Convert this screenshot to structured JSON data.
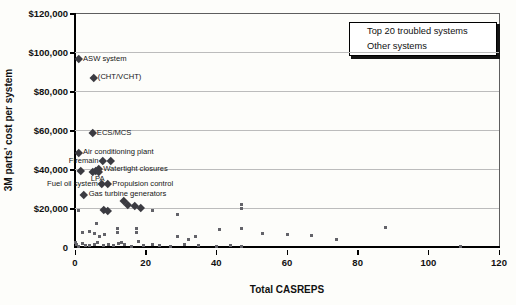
{
  "chart_data": {
    "type": "scatter",
    "title": "",
    "xlabel": "Total CASREPS",
    "ylabel": "3M parts' cost per system",
    "xlim": [
      0,
      120
    ],
    "ylim": [
      0,
      120000
    ],
    "grid": "horizontal",
    "legend_position": "top-right",
    "x_ticks": [
      0,
      20,
      40,
      60,
      80,
      100,
      120
    ],
    "y_ticks": [
      {
        "value": 120000,
        "label": "$120,000"
      },
      {
        "value": 100000,
        "label": "$100,000"
      },
      {
        "value": 80000,
        "label": "$80,000"
      },
      {
        "value": 60000,
        "label": "$60,000"
      },
      {
        "value": 40000,
        "label": "$40,000"
      },
      {
        "value": 20000,
        "label": "$20,000"
      },
      {
        "value": 0,
        "label": "0"
      }
    ],
    "series": [
      {
        "name": "Top 20 troubled systems",
        "marker": "diamond",
        "color": "#3b3b41",
        "points": [
          {
            "x": 1,
            "y": 96500,
            "label": "ASW system",
            "label_side": "right"
          },
          {
            "x": 5.2,
            "y": 87000,
            "label": "(CHT/VCHT)",
            "label_side": "right"
          },
          {
            "x": 4.9,
            "y": 58400,
            "label": "ECS/MCS",
            "label_side": "right"
          },
          {
            "x": 1,
            "y": 48500,
            "label": "Air conditioning plant",
            "label_side": "right"
          },
          {
            "x": 7.9,
            "y": 44000,
            "label": "Firemain",
            "label_side": "left"
          },
          {
            "x": 10,
            "y": 44000
          },
          {
            "x": 6.7,
            "y": 40000,
            "label": "Watertight closures",
            "label_side": "right"
          },
          {
            "x": 1.6,
            "y": 39200
          },
          {
            "x": 6,
            "y": 39000
          },
          {
            "x": 5,
            "y": 38500,
            "label": "LPA",
            "label_side": "below"
          },
          {
            "x": 6.7,
            "y": 38400
          },
          {
            "x": 7.7,
            "y": 32400,
            "label": "Fuel oil system",
            "label_side": "left"
          },
          {
            "x": 9.3,
            "y": 32400,
            "label": "Propulsion control",
            "label_side": "right"
          },
          {
            "x": 2.6,
            "y": 27000,
            "label": "Gas turbine generators",
            "label_side": "right"
          },
          {
            "x": 13.9,
            "y": 23900
          },
          {
            "x": 15,
            "y": 21700
          },
          {
            "x": 17,
            "y": 20900
          },
          {
            "x": 18.5,
            "y": 20200
          },
          {
            "x": 8,
            "y": 18900
          },
          {
            "x": 9.2,
            "y": 18800
          }
        ]
      },
      {
        "name": "Other systems",
        "marker": "square",
        "color": "#636369",
        "points": [
          {
            "x": 0,
            "y": 2500
          },
          {
            "x": 0.3,
            "y": 1200
          },
          {
            "x": 1,
            "y": 18500
          },
          {
            "x": 1,
            "y": 500
          },
          {
            "x": 2,
            "y": 7600
          },
          {
            "x": 2,
            "y": 1800
          },
          {
            "x": 3,
            "y": 700
          },
          {
            "x": 4,
            "y": 8100
          },
          {
            "x": 4,
            "y": 900
          },
          {
            "x": 5.5,
            "y": 1500
          },
          {
            "x": 5.6,
            "y": 7100
          },
          {
            "x": 6,
            "y": 12200
          },
          {
            "x": 6.4,
            "y": 2200
          },
          {
            "x": 7,
            "y": 5600
          },
          {
            "x": 8,
            "y": 900
          },
          {
            "x": 8.3,
            "y": 6500
          },
          {
            "x": 9.4,
            "y": 1200
          },
          {
            "x": 10.8,
            "y": 600
          },
          {
            "x": 12,
            "y": 9400
          },
          {
            "x": 12,
            "y": 7300
          },
          {
            "x": 12.2,
            "y": 1800
          },
          {
            "x": 13.3,
            "y": 2200
          },
          {
            "x": 14.1,
            "y": 1200
          },
          {
            "x": 16,
            "y": 500
          },
          {
            "x": 17.4,
            "y": 9700
          },
          {
            "x": 17.4,
            "y": 7500
          },
          {
            "x": 18,
            "y": 2900
          },
          {
            "x": 19.5,
            "y": 900
          },
          {
            "x": 22,
            "y": 18800
          },
          {
            "x": 22,
            "y": 1400
          },
          {
            "x": 24,
            "y": 900
          },
          {
            "x": 27,
            "y": 500
          },
          {
            "x": 29,
            "y": 16500
          },
          {
            "x": 29,
            "y": 5600
          },
          {
            "x": 31,
            "y": 1200
          },
          {
            "x": 32,
            "y": 3900
          },
          {
            "x": 34,
            "y": 5600
          },
          {
            "x": 35,
            "y": 900
          },
          {
            "x": 40,
            "y": 500
          },
          {
            "x": 41,
            "y": 9000
          },
          {
            "x": 44,
            "y": 850
          },
          {
            "x": 47,
            "y": 21700
          },
          {
            "x": 47,
            "y": 19800
          },
          {
            "x": 47,
            "y": 9700
          },
          {
            "x": 47,
            "y": 300
          },
          {
            "x": 53,
            "y": 7100
          },
          {
            "x": 60,
            "y": 6300
          },
          {
            "x": 67,
            "y": 6000
          },
          {
            "x": 74,
            "y": 3800
          },
          {
            "x": 88,
            "y": 9900
          },
          {
            "x": 109,
            "y": 200
          }
        ]
      }
    ]
  }
}
